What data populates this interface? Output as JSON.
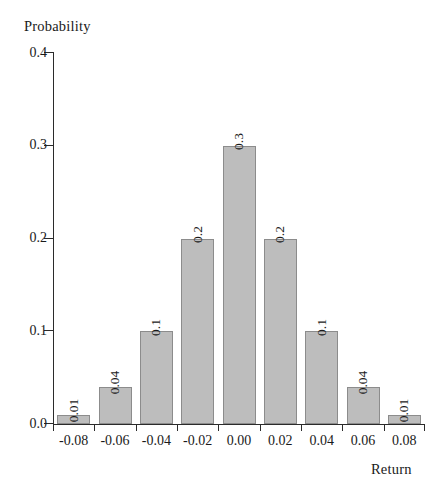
{
  "chart_data": {
    "type": "bar",
    "title": "",
    "xlabel": "Return",
    "ylabel": "Probability",
    "categories": [
      "-0.08",
      "-0.06",
      "-0.04",
      "-0.02",
      "0.00",
      "0.02",
      "0.04",
      "0.06",
      "0.08"
    ],
    "values": [
      0.01,
      0.04,
      0.1,
      0.2,
      0.3,
      0.2,
      0.1,
      0.04,
      0.01
    ],
    "value_labels": [
      "0.01",
      "0.04",
      "0.1",
      "0.2",
      "0.3",
      "0.2",
      "0.1",
      "0.04",
      "0.01"
    ],
    "ylim": [
      0.0,
      0.4
    ],
    "yticks": [
      0.0,
      0.1,
      0.2,
      0.3,
      0.4
    ],
    "ytick_labels": [
      "0.0",
      "0.1",
      "0.2",
      "0.3",
      "0.4"
    ],
    "grid": false,
    "legend": null,
    "bar_color": "#bdbdbd",
    "bar_edge_color": "#8c8c8c",
    "axis_color": "#2b2b2b",
    "value_label_rotation": -90
  },
  "axes": {
    "y_title": "Probability",
    "x_title": "Return"
  }
}
